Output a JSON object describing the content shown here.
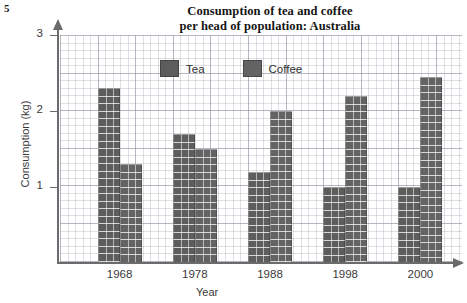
{
  "question_number": "5",
  "chart_data": {
    "type": "bar",
    "title": "Consumption of tea and coffee per head of population: Australia",
    "title_line1": "Consumption of tea and coffee",
    "title_line2": "per head of population: Australia",
    "xlabel": "Year",
    "ylabel": "Consumption (kg)",
    "categories": [
      "1968",
      "1978",
      "1988",
      "1998",
      "2000"
    ],
    "series": [
      {
        "name": "Tea",
        "color": "#5d5d5d",
        "values": [
          2.3,
          1.7,
          1.2,
          1.0,
          1.0
        ]
      },
      {
        "name": "Coffee",
        "color": "#636363",
        "values": [
          1.3,
          1.5,
          2.0,
          2.2,
          2.45
        ]
      }
    ],
    "ylim": [
      0,
      3
    ],
    "yticks": [
      "1",
      "2",
      "3"
    ],
    "ytick_values": [
      1,
      2,
      3
    ],
    "grid": "graph-paper",
    "legend_position": "top-center"
  }
}
